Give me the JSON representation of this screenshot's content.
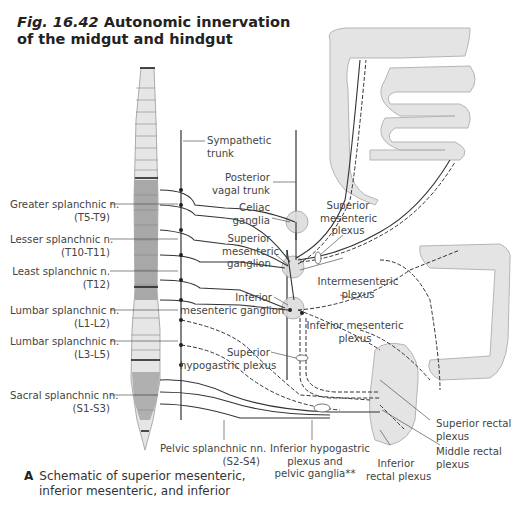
{
  "figure": {
    "number": "Fig. 16.42",
    "title_line1": "Autonomic innervation",
    "title_line2": "of the midgut and hindgut"
  },
  "left_labels": [
    {
      "name": "Greater splanchnic n.",
      "levels": "(T5-T9)"
    },
    {
      "name": "Lesser splanchnic n.",
      "levels": "(T10-T11)"
    },
    {
      "name": "Least splanchnic n.",
      "levels": "(T12)"
    },
    {
      "name": "Lumbar splanchnic n.",
      "levels": "(L1-L2)"
    },
    {
      "name": "Lumbar splanchnic n.",
      "levels": "(L3-L5)"
    },
    {
      "name": "Sacral splanchnic nn.",
      "levels": "(S1-S3)"
    }
  ],
  "center_labels": {
    "sympathetic_trunk": [
      "Sympathetic",
      "trunk"
    ],
    "posterior_vagal_trunk": [
      "Posterior",
      "vagal trunk"
    ],
    "celiac_ganglia": [
      "Celiac",
      "ganglia"
    ],
    "superior_mesenteric_ganglion": [
      "Superior",
      "mesenteric",
      "ganglion"
    ],
    "inferior_mesenteric_ganglion": [
      "Inferior",
      "mesenteric ganglion"
    ],
    "superior_hypogastric_plexus": [
      "Superior",
      "hypogastric plexus"
    ]
  },
  "right_labels": {
    "superior_mesenteric_plexus": [
      "Superior",
      "mesenteric",
      "plexus"
    ],
    "intermesenteric_plexus": [
      "Intermesenteric",
      "plexus"
    ],
    "inferior_mesenteric_plexus": [
      "Inferior mesenteric",
      "plexus"
    ],
    "superior_rectal_plexus": [
      "Superior rectal",
      "plexus"
    ],
    "middle_rectal_plexus": [
      "Middle rectal",
      "plexus"
    ]
  },
  "bottom_labels": {
    "pelvic_splanchnic": [
      "Pelvic splanchnic nn.",
      "(S2-S4)"
    ],
    "inferior_hypogastric": [
      "Inferior hypogastric",
      "plexus and",
      "pelvic ganglia**"
    ],
    "inferior_rectal": [
      "Inferior",
      "rectal plexus"
    ]
  },
  "caption": {
    "letter": "A",
    "line1": "Schematic of superior mesenteric,",
    "line2": "inferior mesenteric, and inferior"
  },
  "colors": {
    "gut_fill": "#e4e4e4",
    "gut_stroke": "#b5b5b5",
    "spine_light": "#e6e6e6",
    "spine_dark": "#a8a8a8",
    "nerve": "#333333"
  }
}
